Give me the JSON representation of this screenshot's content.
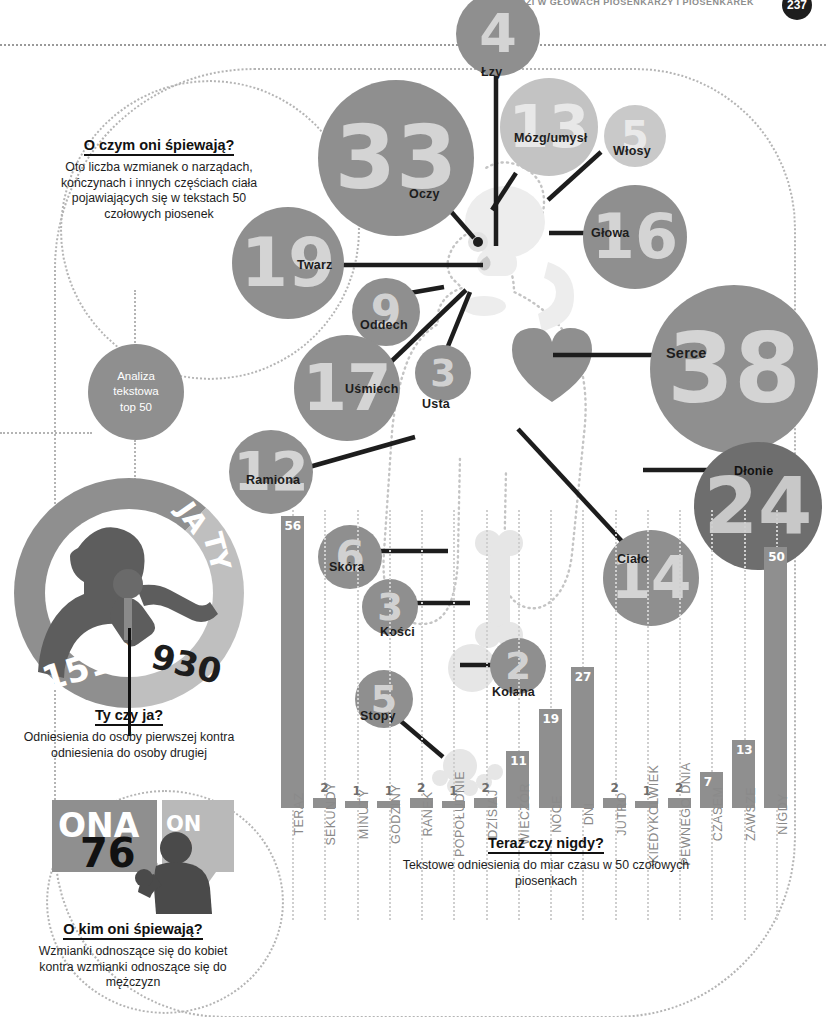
{
  "header": {
    "kicker": "CO SIEDZI W GŁOWACH PIOSENKARZY I PIOSENKAREK",
    "page_number": "237"
  },
  "intro": {
    "title": "O czym oni śpiewają?",
    "body": "Oto liczba wzmianek o narządach, kończynach i innych częściach ciała pojawiających się w tekstach 50 czołowych piosenek"
  },
  "analysis_badge": {
    "line1": "Analiza",
    "line2": "tekstowa",
    "line3": "top 50"
  },
  "body_parts": [
    {
      "label": "Oczy",
      "value": "33",
      "name": "bubble-oczy"
    },
    {
      "label": "Łzy",
      "value": "4",
      "name": "bubble-lzy"
    },
    {
      "label": "Mózg/umysł",
      "value": "13",
      "name": "bubble-mozg"
    },
    {
      "label": "Włosy",
      "value": "5",
      "name": "bubble-wlosy"
    },
    {
      "label": "Głowa",
      "value": "16",
      "name": "bubble-glowa"
    },
    {
      "label": "Twarz",
      "value": "19",
      "name": "bubble-twarz"
    },
    {
      "label": "Oddech",
      "value": "9",
      "name": "bubble-oddech"
    },
    {
      "label": "Uśmiech",
      "value": "17",
      "name": "bubble-usmiech"
    },
    {
      "label": "Usta",
      "value": "3",
      "name": "bubble-usta"
    },
    {
      "label": "Ramiona",
      "value": "12",
      "name": "bubble-ramiona"
    },
    {
      "label": "Serce",
      "value": "38",
      "name": "bubble-serce"
    },
    {
      "label": "Dłonie",
      "value": "24",
      "name": "bubble-dlonie"
    },
    {
      "label": "Ciało",
      "value": "14",
      "name": "bubble-cialo"
    },
    {
      "label": "Skóra",
      "value": "6",
      "name": "bubble-skora"
    },
    {
      "label": "Kości",
      "value": "3",
      "name": "bubble-kosci"
    },
    {
      "label": "Kolana",
      "value": "2",
      "name": "bubble-kolana"
    },
    {
      "label": "Stopy",
      "value": "5",
      "name": "bubble-stopy"
    }
  ],
  "person_donut": {
    "title": "Ty czy ja?",
    "body": "Odniesienia do osoby pierwszej kontra odniesienia do osoby drugiej",
    "first_person_label": "JA",
    "second_person_label": "TY",
    "first_person_value": "1513",
    "second_person_value": "930"
  },
  "gender": {
    "title": "O kim oni śpiewają?",
    "body": "Wzmianki odnoszące się do kobiet kontra wzmianki odnoszące się do mężczyzn",
    "she_label": "ONA",
    "she_value": "76",
    "he_label": "ON",
    "he_value": "40"
  },
  "time_chart": {
    "title": "Teraz czy nigdy?",
    "body": "Tekstowe odniesienia do miar czasu w 50 czołowych piosenkach"
  },
  "colors": {
    "bubble_mid": "#8f8f8f",
    "bubble_light": "#c3c3c3",
    "bubble_dark": "#6e6e6e",
    "bar": "#8f8f8f",
    "ink": "#1d1d1d",
    "dotted": "#b4b4b4"
  },
  "chart_data": {
    "type": "bar",
    "title": "Teraz czy nigdy?",
    "subtitle": "Tekstowe odniesienia do miar czasu w 50 czołowych piosenkach",
    "xlabel": "",
    "ylabel": "",
    "ylim": [
      0,
      56
    ],
    "grid": true,
    "legend": "none",
    "categories": [
      "TERAZ",
      "SEKUNDY",
      "MINUTY",
      "GODZINY",
      "RANEK",
      "POPOŁUDNIE",
      "DZISIAJ",
      "WIECZÓR",
      "NOCE",
      "DNI",
      "JUTRO",
      "KIEDYKOLWIEK",
      "PEWNEGO DNIA",
      "CZASEM",
      "ZAWSZE",
      "NIGDY"
    ],
    "values": [
      56,
      2,
      1,
      1,
      2,
      1,
      2,
      11,
      19,
      27,
      2,
      1,
      2,
      7,
      13,
      50
    ]
  },
  "bubble_chart_data": {
    "type": "bubble",
    "title": "O czym oni śpiewają?",
    "subtitle": "Oto liczba wzmianek o narządach, kończynach i innych częściach ciała pojawiających się w tekstach 50 czołowych piosenek",
    "categories": [
      "Serce",
      "Oczy",
      "Dłonie",
      "Twarz",
      "Uśmiech",
      "Głowa",
      "Ciało",
      "Mózg/umysł",
      "Ramiona",
      "Oddech",
      "Skóra",
      "Włosy",
      "Stopy",
      "Łzy",
      "Usta",
      "Kości",
      "Kolana"
    ],
    "values": [
      38,
      33,
      24,
      19,
      17,
      16,
      14,
      13,
      12,
      9,
      6,
      5,
      5,
      4,
      3,
      3,
      2
    ]
  },
  "ratio_charts": [
    {
      "type": "donut",
      "title": "Ty czy ja?",
      "labels": [
        "JA",
        "TY"
      ],
      "values": [
        1513,
        930
      ]
    },
    {
      "type": "pictorial",
      "title": "O kim oni śpiewają?",
      "labels": [
        "ONA",
        "ON"
      ],
      "values": [
        76,
        40
      ]
    }
  ]
}
